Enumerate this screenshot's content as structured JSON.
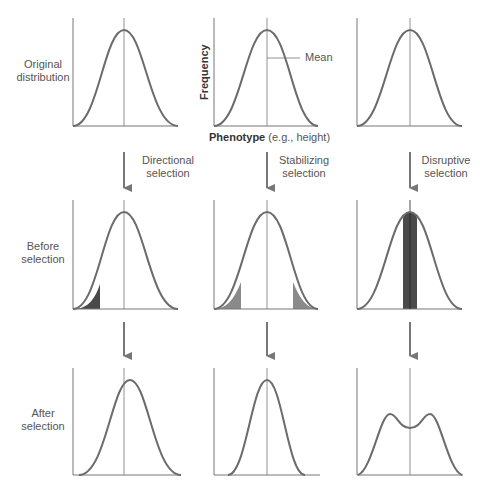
{
  "row_labels": {
    "original": [
      "Original",
      "distribution"
    ],
    "before": [
      "Before",
      "selection"
    ],
    "after": [
      "After",
      "selection"
    ]
  },
  "selection_labels": {
    "directional": [
      "Directional",
      "selection"
    ],
    "stabilizing": [
      "Stabilizing",
      "selection"
    ],
    "disruptive": [
      "Disruptive",
      "selection"
    ]
  },
  "annotations": {
    "mean": "Mean",
    "y_axis": "Frequency",
    "x_axis_bold": "Phenotype",
    "x_axis_rest": " (e.g., height)"
  },
  "colors": {
    "curve": "#6b6b6b",
    "axis": "#777777",
    "arrow": "#777777",
    "shade_dark": "#4a4a4a",
    "shade_mid": "#8a8a8a"
  }
}
